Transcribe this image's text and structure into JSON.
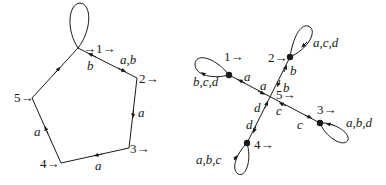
{
  "diagram": {
    "left_graph": {
      "states": [
        {
          "id": "1",
          "label": "→1→"
        },
        {
          "id": "2",
          "label": "2→"
        },
        {
          "id": "3",
          "label": "3→"
        },
        {
          "id": "4",
          "label": "4→"
        },
        {
          "id": "5",
          "label": "5→"
        }
      ],
      "edges": [
        {
          "from": "1",
          "to": "2",
          "label": "a,b"
        },
        {
          "from": "2",
          "to": "1",
          "label": "b"
        },
        {
          "from": "2",
          "to": "3",
          "label": "a"
        },
        {
          "from": "3",
          "to": "4",
          "label": "a"
        },
        {
          "from": "4",
          "to": "5",
          "label": "a"
        },
        {
          "from": "5",
          "to": "1",
          "label": ""
        },
        {
          "from": "1",
          "to": "1",
          "label": ""
        }
      ]
    },
    "right_graph": {
      "states": [
        {
          "id": "1",
          "label": "1→"
        },
        {
          "id": "2",
          "label": "2→"
        },
        {
          "id": "3",
          "label": "3→"
        },
        {
          "id": "4",
          "label": "4→"
        },
        {
          "id": "5",
          "label": "5→"
        }
      ],
      "edges": [
        {
          "from": "1",
          "to": "1",
          "label": "b,c,d"
        },
        {
          "from": "2",
          "to": "2",
          "label": "a,c,d"
        },
        {
          "from": "3",
          "to": "3",
          "label": "a,b,d"
        },
        {
          "from": "4",
          "to": "4",
          "label": "a,b,c"
        },
        {
          "from": "5",
          "to": "1",
          "label": "a"
        },
        {
          "from": "1",
          "to": "5",
          "label": "a"
        },
        {
          "from": "5",
          "to": "2",
          "label": "b"
        },
        {
          "from": "2",
          "to": "5",
          "label": "b"
        },
        {
          "from": "5",
          "to": "3",
          "label": "c"
        },
        {
          "from": "3",
          "to": "5",
          "label": "c"
        },
        {
          "from": "5",
          "to": "4",
          "label": "d"
        },
        {
          "from": "4",
          "to": "5",
          "label": "d"
        }
      ]
    },
    "colors": {
      "ink": "#1a1a1a",
      "background": "#ffffff"
    }
  }
}
